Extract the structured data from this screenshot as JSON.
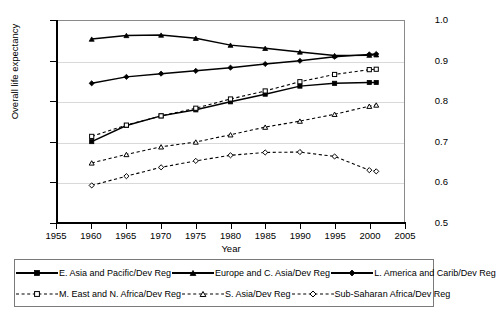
{
  "chart_data": {
    "type": "line",
    "title": "",
    "xlabel": "Year",
    "ylabel": "Overall life expectancy",
    "xlim": [
      1955,
      2005
    ],
    "ylim": [
      0.5,
      1.0
    ],
    "grid": true,
    "legend_position": "bottom",
    "x_ticks": [
      "1955",
      "1960",
      "1965",
      "1970",
      "1975",
      "1980",
      "1985",
      "1990",
      "1995",
      "2000",
      "2005"
    ],
    "y_ticks": [
      "0.5",
      "0.6",
      "0.7",
      "0.8",
      "0.9",
      "1.0"
    ],
    "x": [
      1960,
      1965,
      1970,
      1975,
      1980,
      1985,
      1990,
      1995,
      2000,
      2001
    ],
    "series": [
      {
        "name": "E. Asia and Pacific/Dev Reg",
        "marker": "filled-square",
        "line": "solid",
        "values": [
          0.7,
          0.74,
          0.764,
          0.779,
          0.799,
          0.818,
          0.838,
          0.845,
          0.847,
          0.847
        ]
      },
      {
        "name": "Europe and C. Asia/Dev Reg",
        "marker": "filled-triangle",
        "line": "solid",
        "values": [
          0.955,
          0.964,
          0.965,
          0.957,
          0.94,
          0.932,
          0.923,
          0.914,
          0.915,
          0.916
        ]
      },
      {
        "name": "L. America and Carib/Dev Reg",
        "marker": "filled-diamond",
        "line": "solid",
        "values": [
          0.845,
          0.861,
          0.869,
          0.876,
          0.884,
          0.893,
          0.901,
          0.911,
          0.917,
          0.918
        ]
      },
      {
        "name": "M. East and N. Africa/Dev Reg",
        "marker": "open-square",
        "line": "dashed",
        "values": [
          0.713,
          0.741,
          0.764,
          0.783,
          0.806,
          0.826,
          0.849,
          0.867,
          0.879,
          0.88
        ]
      },
      {
        "name": "S. Asia/Dev Reg",
        "marker": "open-triangle",
        "line": "dashed",
        "values": [
          0.647,
          0.668,
          0.687,
          0.699,
          0.717,
          0.736,
          0.751,
          0.768,
          0.788,
          0.791
        ]
      },
      {
        "name": "Sub-Saharan Africa/Dev Reg",
        "marker": "open-diamond",
        "line": "dashed",
        "values": [
          0.591,
          0.614,
          0.636,
          0.652,
          0.666,
          0.673,
          0.674,
          0.663,
          0.629,
          0.626
        ]
      }
    ]
  },
  "legend": {
    "rows": [
      [
        {
          "label": "E. Asia and Pacific/Dev Reg",
          "series": 0
        },
        {
          "label": "Europe and C. Asia/Dev Reg",
          "series": 1
        },
        {
          "label": "L. America and Carib/Dev Reg",
          "series": 2
        }
      ],
      [
        {
          "label": "M. East and N. Africa/Dev Reg",
          "series": 3
        },
        {
          "label": "S. Asia/Dev Reg",
          "series": 4
        },
        {
          "label": "Sub-Saharan Africa/Dev Reg",
          "series": 5
        }
      ]
    ]
  },
  "colors": {
    "series": "#000000",
    "gridline": "#d9d9d9",
    "axis": "#000000",
    "plot_border": "#8a8a8a",
    "background": "#ffffff"
  }
}
